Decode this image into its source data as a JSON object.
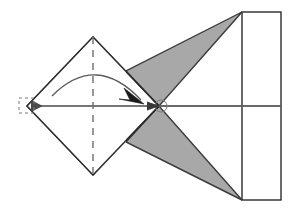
{
  "figure": {
    "title": "Origami fold diagram: square flap folded to the right onto a rectangular sheet",
    "caption": "",
    "width": 294,
    "height": 213,
    "background_color": "#ffffff"
  },
  "colors": {
    "outline": "#2b2b2b",
    "shaded_fill": "#a8a8a8",
    "shaded_stroke": "#3a3a3a",
    "paper_fill": "#ffffff",
    "axis_dark": "#4a4a4a",
    "axis_light": "#b0b0b0",
    "dash_line": "#6e6e6e",
    "arc_line": "#5a5a5a",
    "marker_stroke": "#7a7a7a"
  },
  "shapes": {
    "sheet_rectangle": {
      "name": "paper-sheet",
      "x": 242,
      "y": 12,
      "width": 39,
      "height": 188,
      "fill": "#ffffff",
      "stroke": "#2b2b2b",
      "stroke_width": 1.4
    },
    "diamond": {
      "name": "folded-square-flap",
      "points": "27,106 93,37 159,106 93,175",
      "fill": "#ffffff",
      "stroke": "#2b2b2b",
      "stroke_width": 1.4
    },
    "shaded_triangle_upper": {
      "name": "shaded-region-upper",
      "points": "159,106 126,71 242,12",
      "fill": "#a8a8a8",
      "stroke": "#3a3a3a",
      "stroke_width": 1.4
    },
    "shaded_triangle_lower": {
      "name": "shaded-region-lower",
      "points": "159,106 126,142 242,200",
      "fill": "#a8a8a8",
      "stroke": "#3a3a3a",
      "stroke_width": 1.4
    }
  },
  "lines": {
    "center_axis_left": {
      "name": "center-axis-arrow-segment",
      "x1": 281,
      "y1": 106,
      "x2": 30,
      "y2": 106,
      "stroke": "#4a4a4a",
      "stroke_width": 1.6,
      "arrowhead": "left"
    },
    "center_axis_right": {
      "name": "center-axis-light-segment",
      "x1": 159,
      "y1": 106,
      "x2": 281,
      "y2": 106,
      "stroke": "#b0b0b0",
      "stroke_width": 1.3
    },
    "fold_crease": {
      "name": "fold-crease-dashed-line",
      "x1": 93,
      "y1": 37,
      "x2": 93,
      "y2": 175,
      "stroke": "#6e6e6e",
      "stroke_width": 1.4,
      "dash_pattern": "7,6"
    }
  },
  "annotations": {
    "fold_arc": {
      "name": "fold-direction-arc",
      "path": "M 52,96 Q 96,52 141,99",
      "stroke": "#5a5a5a",
      "stroke_width": 1.3,
      "arrowhead": "end"
    },
    "left_vertex_marker": {
      "name": "left-vertex-dashed-square-marker",
      "x": 19,
      "y": 98,
      "size": 16,
      "stroke": "#7a7a7a",
      "dash_pattern": "3,3"
    },
    "center_vertex_marker": {
      "name": "center-vertex-circle-marker",
      "cx": 161,
      "cy": 106,
      "r": 6,
      "stroke": "#7a7a7a"
    },
    "center_arrowhead": {
      "name": "center-pointing-arrowhead",
      "points": "159,106 146,101 146,111"
    },
    "arc_arrowhead": {
      "name": "arc-tip-arrowhead",
      "points": "143,102 126,90 131,103 121,101"
    }
  },
  "chart_data": {
    "type": "diagram",
    "elements": [
      {
        "label": "paper-sheet-rectangle",
        "role": "base sheet",
        "shade": "white"
      },
      {
        "label": "square-flap-diamond",
        "role": "flap before fold",
        "shade": "white"
      },
      {
        "label": "upper-shaded-triangle",
        "role": "revealed underside",
        "shade": "gray"
      },
      {
        "label": "lower-shaded-triangle",
        "role": "revealed underside",
        "shade": "gray"
      },
      {
        "label": "vertical-dashed-crease",
        "role": "fold line",
        "shade": "dashed"
      },
      {
        "label": "horizontal-center-axis",
        "role": "symmetry axis",
        "shade": "line"
      },
      {
        "label": "curved-fold-arrow",
        "role": "fold motion indicator",
        "shade": "arrow"
      }
    ]
  }
}
